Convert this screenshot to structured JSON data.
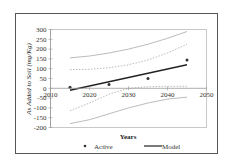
{
  "chart_data": {
    "type": "line",
    "title": "",
    "xlabel": "Years",
    "ylabel": "As Added to Soil (mg/Kg)",
    "xlim": [
      2010,
      2050
    ],
    "ylim": [
      -200,
      300
    ],
    "xticks": [
      2010,
      2020,
      2030,
      2040,
      2050
    ],
    "xtick_labels": [
      "2010",
      "2020",
      "2030",
      "2040",
      "2050"
    ],
    "yticks": [
      300,
      250,
      200,
      150,
      100,
      50,
      0,
      -50,
      -100,
      -150,
      -200
    ],
    "ytick_labels": [
      "300",
      "250",
      "200",
      "150",
      "100",
      "50",
      "0",
      "-50",
      "-100",
      "-150",
      "-200"
    ],
    "grid": false,
    "legend_position": "bottom",
    "series": [
      {
        "name": "Active",
        "kind": "scatter",
        "x": [
          2015,
          2025,
          2035,
          2045
        ],
        "y": [
          5,
          20,
          50,
          145
        ],
        "color": "#333333"
      },
      {
        "name": "Model",
        "kind": "line",
        "x": [
          2015,
          2045
        ],
        "y": [
          -10,
          120
        ],
        "color": "#222222"
      },
      {
        "name": "Upper prediction bound",
        "kind": "line",
        "style": "solid",
        "x": [
          2015,
          2020,
          2025,
          2030,
          2035,
          2040,
          2045
        ],
        "y": [
          155,
          165,
          180,
          200,
          225,
          255,
          290
        ],
        "color": "#aaaaaa"
      },
      {
        "name": "Upper confidence bound",
        "kind": "line",
        "style": "dashed",
        "x": [
          2015,
          2020,
          2025,
          2030,
          2035,
          2040,
          2045
        ],
        "y": [
          95,
          97,
          105,
          120,
          145,
          180,
          225
        ],
        "color": "#aaaaaa"
      },
      {
        "name": "Lower confidence bound",
        "kind": "line",
        "style": "dashed",
        "x": [
          2015,
          2020,
          2025,
          2030,
          2035,
          2040,
          2045
        ],
        "y": [
          -115,
          -75,
          -30,
          0,
          8,
          10,
          10
        ],
        "color": "#aaaaaa"
      },
      {
        "name": "Lower prediction bound",
        "kind": "line",
        "style": "solid",
        "x": [
          2015,
          2020,
          2025,
          2030,
          2035,
          2040,
          2045
        ],
        "y": [
          -180,
          -160,
          -130,
          -100,
          -75,
          -55,
          -45
        ],
        "color": "#aaaaaa"
      }
    ],
    "legend": [
      {
        "label": "Active",
        "marker": "dot"
      },
      {
        "label": "Model",
        "marker": "line"
      }
    ]
  }
}
